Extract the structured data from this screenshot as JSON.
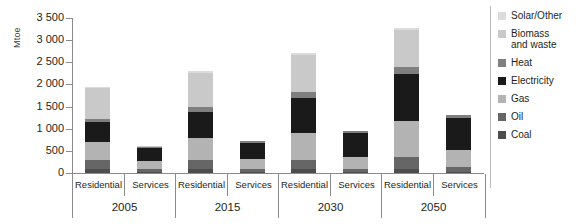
{
  "chart_data": {
    "type": "bar",
    "stacked": true,
    "title": "",
    "xlabel": "",
    "ylabel": "Mtoe",
    "ylim": [
      0,
      3500
    ],
    "yticks": [
      0,
      500,
      1000,
      1500,
      2000,
      2500,
      3000,
      3500
    ],
    "ytick_labels": [
      "0",
      "500",
      "1 000",
      "1 500",
      "2 000",
      "2 500",
      "3 000",
      "3 500"
    ],
    "grid": false,
    "legend_position": "right",
    "groups": [
      {
        "year": "2005",
        "sectors": [
          "Residential",
          "Services"
        ]
      },
      {
        "year": "2015",
        "sectors": [
          "Residential",
          "Services"
        ]
      },
      {
        "year": "2030",
        "sectors": [
          "Residential",
          "Services"
        ]
      },
      {
        "year": "2050",
        "sectors": [
          "Residential",
          "Services"
        ]
      }
    ],
    "categories": [
      "2005 Residential",
      "2005 Services",
      "2015 Residential",
      "2015 Services",
      "2030 Residential",
      "2030 Services",
      "2050 Residential",
      "2050 Services"
    ],
    "series": [
      {
        "name": "Coal",
        "color": "#4d4d4d",
        "values": [
          90,
          25,
          80,
          20,
          80,
          20,
          90,
          30
        ]
      },
      {
        "name": "Oil",
        "color": "#666666",
        "values": [
          210,
          70,
          210,
          70,
          220,
          80,
          280,
          100
        ]
      },
      {
        "name": "Gas",
        "color": "#b3b3b3",
        "values": [
          400,
          180,
          490,
          220,
          600,
          270,
          810,
          380
        ]
      },
      {
        "name": "Electricity",
        "color": "#1a1a1a",
        "values": [
          450,
          290,
          600,
          370,
          800,
          540,
          1060,
          740
        ]
      },
      {
        "name": "Heat",
        "color": "#7f7f7f",
        "values": [
          70,
          30,
          110,
          35,
          130,
          40,
          160,
          50
        ]
      },
      {
        "name": "Biomass and waste",
        "color": "#c9c9c9",
        "values": [
          700,
          5,
          780,
          5,
          830,
          10,
          830,
          10
        ]
      },
      {
        "name": "Solar/Other",
        "color": "#dcdcdc",
        "values": [
          20,
          0,
          30,
          0,
          40,
          0,
          50,
          0
        ]
      }
    ],
    "totals": [
      1940,
      600,
      2300,
      720,
      2700,
      960,
      3280,
      1310
    ]
  },
  "legend": {
    "items": [
      {
        "label": "Solar/Other",
        "color": "#dcdcdc"
      },
      {
        "label": "Biomass\nand waste",
        "color": "#c9c9c9"
      },
      {
        "label": "Heat",
        "color": "#7f7f7f"
      },
      {
        "label": "Electricity",
        "color": "#1a1a1a"
      },
      {
        "label": "Gas",
        "color": "#b3b3b3"
      },
      {
        "label": "Oil",
        "color": "#666666"
      },
      {
        "label": "Coal",
        "color": "#4d4d4d"
      }
    ]
  },
  "axis": {
    "y_title": "Mtoe",
    "axis_color": "#8b8b8b"
  }
}
